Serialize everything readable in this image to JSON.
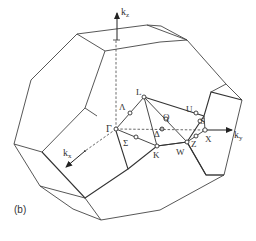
{
  "figure": {
    "panel_label": "(b)",
    "axes": {
      "kz": {
        "label": "k",
        "subscript": "z"
      },
      "ky": {
        "label": "k",
        "subscript": "y"
      },
      "kx": {
        "label": "k",
        "subscript": "x"
      }
    },
    "points": {
      "gamma": "Γ",
      "lambda": "Λ",
      "L": "L",
      "sigma": "Σ",
      "K": "K",
      "delta": "Δ",
      "Q": "Q",
      "W": "W",
      "Z": "Z",
      "X": "X",
      "U": "U",
      "S": "S"
    },
    "colors": {
      "line": "#333333",
      "background": "#ffffff"
    }
  }
}
